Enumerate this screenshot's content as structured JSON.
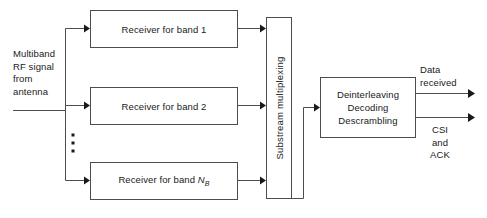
{
  "diagram": {
    "stroke_color": "#4d4d4d",
    "arrow_color": "#1a1a1a",
    "text_color": "#1a1a1a",
    "background_color": "#ffffff",
    "input_label": "Multiband\nRF signal\nfrom\nantenna",
    "receivers": [
      {
        "label": "Receiver for band 1"
      },
      {
        "label": "Receiver for band 2"
      },
      {
        "label_prefix": "Receiver for band ",
        "label_var": "N",
        "label_sub": "B"
      }
    ],
    "ellipsis": "vertical-dots",
    "multiplex_block": {
      "label": "Substream multiplexing"
    },
    "processing_block": {
      "line1": "Deinterleaving",
      "line2": "Decoding",
      "line3": "Descrambling"
    },
    "outputs": [
      {
        "label": "Data\nreceived"
      },
      {
        "label": "CSI\nand\nACK"
      }
    ]
  }
}
